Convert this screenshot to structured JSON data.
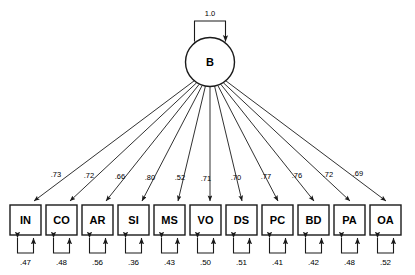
{
  "figure": {
    "type": "path-diagram"
  },
  "factor": {
    "name": "B",
    "shape": "circle",
    "variance_label": "1.0",
    "variance_arrow": "double-headed-self-loop"
  },
  "indicators": [
    {
      "name": "IN",
      "loading": ".73",
      "residual": ".47"
    },
    {
      "name": "CO",
      "loading": ".72",
      "residual": ".48"
    },
    {
      "name": "AR",
      "loading": ".66",
      "residual": ".56"
    },
    {
      "name": "SI",
      "loading": ".80",
      "residual": ".36"
    },
    {
      "name": "MS",
      "loading": ".52",
      "residual": ".43"
    },
    {
      "name": "VO",
      "loading": ".71",
      "residual": ".50"
    },
    {
      "name": "DS",
      "loading": ".70",
      "residual": ".51"
    },
    {
      "name": "PC",
      "loading": ".77",
      "residual": ".41"
    },
    {
      "name": "BD",
      "loading": ".76",
      "residual": ".42"
    },
    {
      "name": "PA",
      "loading": ".72",
      "residual": ".48"
    },
    {
      "name": "OA",
      "loading": ".69",
      "residual": ".52"
    }
  ],
  "colors": {
    "stroke": "#1a1a1a",
    "fill": "#ffffff",
    "text": "#000000"
  }
}
